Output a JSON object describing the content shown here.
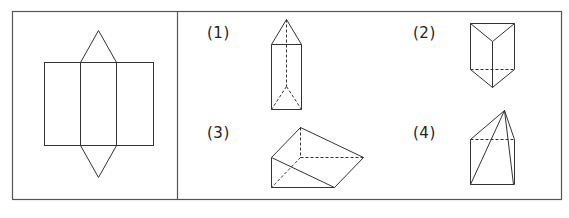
{
  "diagram": {
    "colors": {
      "stroke": "#333333",
      "border": "#555555",
      "background": "#ffffff"
    },
    "net": {
      "name": "triangular-prism-net",
      "rectangle": {
        "x1": 44,
        "y1": 62,
        "x2": 153,
        "y2": 145
      },
      "middle_face": {
        "x1": 80,
        "x2": 116
      },
      "top_triangle_apex": [
        98,
        30
      ],
      "bottom_triangle_apex": [
        98,
        177
      ]
    },
    "options": [
      {
        "label": "(1)",
        "shape": "tall triangular prism with dashed hidden edges"
      },
      {
        "label": "(2)",
        "shape": "triangular prism viewed from above"
      },
      {
        "label": "(3)",
        "shape": "triangular prism lying on its side (wedge)"
      },
      {
        "label": "(4)",
        "shape": "pyramid-like solid on a square base"
      }
    ]
  }
}
